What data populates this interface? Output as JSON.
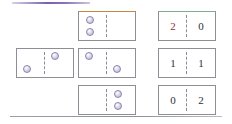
{
  "decor": {
    "top_rule_color": "#7b5fb0",
    "bottom_rule_color": "#8b9299"
  },
  "colors": {
    "pip_fill": "#b3aed0",
    "pip_stroke": "#8b86ad",
    "tile_border": "#8e8e96",
    "accent_orange": "#c08a3e",
    "accent_green": "#7fae8e",
    "accent_red": "#963038",
    "digit": "#2f2f35"
  },
  "rows": [
    {
      "left": null,
      "center": {
        "kind": "pips",
        "accent": "orange",
        "left_pips": 2,
        "right_pips": 0,
        "layout": "stacked"
      },
      "right": {
        "kind": "numbers",
        "accent": "green",
        "left_value": "2",
        "right_value": "0",
        "left_accent": "red"
      }
    },
    {
      "left": {
        "kind": "pips",
        "accent": "none",
        "left_pips": 1,
        "right_pips": 1,
        "layout": "diagonal-down"
      },
      "center": {
        "kind": "pips",
        "accent": "none",
        "left_pips": 1,
        "right_pips": 1,
        "layout": "diagonal-up"
      },
      "right": {
        "kind": "numbers",
        "accent": "none",
        "left_value": "1",
        "right_value": "1",
        "left_accent": "none"
      }
    },
    {
      "left": null,
      "center": {
        "kind": "pips",
        "accent": "none",
        "left_pips": 0,
        "right_pips": 2,
        "layout": "stacked"
      },
      "right": {
        "kind": "numbers",
        "accent": "none",
        "left_value": "0",
        "right_value": "2",
        "left_accent": "none"
      }
    }
  ]
}
